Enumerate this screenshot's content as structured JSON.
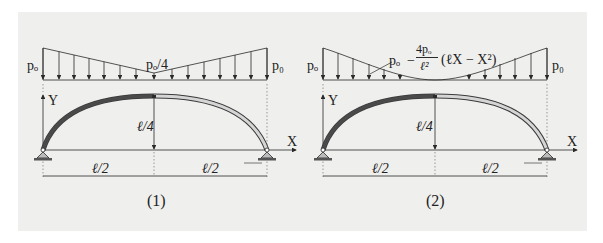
{
  "colors": {
    "background": "#ffffff",
    "panel": "#efefed",
    "line": "#2a2a2a",
    "arch_dark": "#3a3a3a",
    "arch_light": "#d8d8d8"
  },
  "figure1": {
    "caption": "(1)",
    "load_left": "pₒ",
    "load_mid": "pₒ/4",
    "load_right": "p₀",
    "axis_y": "Y",
    "axis_x": "X",
    "rise": "ℓ/4",
    "span_left": "ℓ/2",
    "span_right": "ℓ/2"
  },
  "figure2": {
    "caption": "(2)",
    "load_left": "pₒ",
    "load_right": "p₀",
    "load_formula_p": "pₒ",
    "load_formula_minus": "−",
    "load_formula_num": "4pₒ",
    "load_formula_den": "ℓ²",
    "load_formula_tail": "(ℓX − X²)",
    "axis_y": "Y",
    "axis_x": "X",
    "rise": "ℓ/4",
    "span_left": "ℓ/2",
    "span_right": "ℓ/2"
  }
}
